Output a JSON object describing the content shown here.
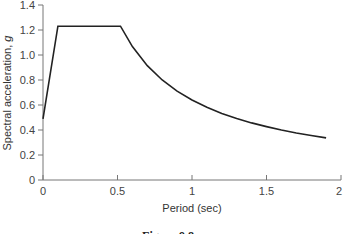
{
  "chart_data": {
    "type": "line",
    "title": "",
    "xlabel": "Period (sec)",
    "ylabel": "Spectral acceleration, g",
    "xlim": [
      0,
      2
    ],
    "ylim": [
      0,
      1.4
    ],
    "xticks": [
      0,
      0.5,
      1,
      1.5,
      2
    ],
    "xtick_labels": [
      "0",
      "0.5",
      "1",
      "1.5",
      "2"
    ],
    "yticks": [
      0,
      0.2,
      0.4,
      0.6,
      0.8,
      1.0,
      1.2,
      1.4
    ],
    "ytick_labels": [
      "0",
      "0.2",
      "0.4",
      "0.6",
      "0.8",
      "1.0",
      "1.2",
      "1.4"
    ],
    "grid": false,
    "legend": null,
    "series": [
      {
        "name": "Design response spectrum",
        "x": [
          0,
          0.1,
          0.52,
          0.6,
          0.7,
          0.8,
          0.9,
          1.0,
          1.1,
          1.2,
          1.3,
          1.4,
          1.5,
          1.6,
          1.7,
          1.8,
          1.9
        ],
        "y": [
          0.49,
          1.23,
          1.23,
          1.067,
          0.914,
          0.8,
          0.711,
          0.64,
          0.582,
          0.533,
          0.492,
          0.457,
          0.427,
          0.4,
          0.376,
          0.356,
          0.337
        ]
      }
    ]
  },
  "caption": "Figure 9.8",
  "colors": {
    "line": "#222222",
    "axis": "#777777"
  }
}
